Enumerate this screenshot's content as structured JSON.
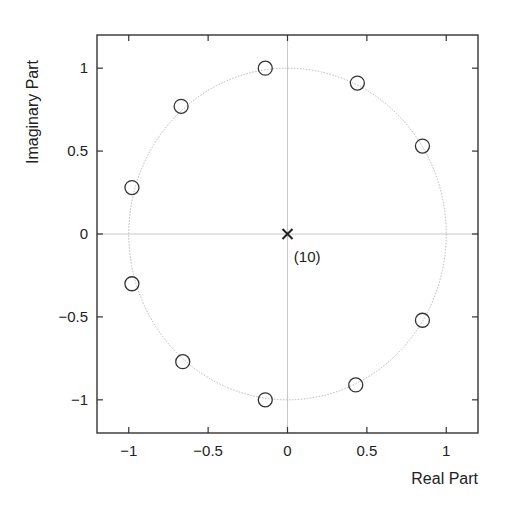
{
  "chart_data": {
    "type": "scatter",
    "subtype": "pole-zero plot",
    "title": "",
    "xlabel": "Real Part",
    "ylabel": "Imaginary Part",
    "xlim": [
      -1.2,
      1.2
    ],
    "ylim": [
      -1.2,
      1.2
    ],
    "xticks": [
      -1,
      -0.5,
      0,
      0.5,
      1
    ],
    "xtick_labels": [
      "−1",
      "−0.5",
      "0",
      "0.5",
      "1"
    ],
    "yticks": [
      -1,
      -0.5,
      0,
      0.5,
      1
    ],
    "ytick_labels": [
      "−1",
      "−0.5",
      "0",
      "0.5",
      "1"
    ],
    "grid": false,
    "unit_circle": true,
    "series": [
      {
        "name": "zeros",
        "marker": "o",
        "points": [
          {
            "x": -0.14,
            "y": 1.0
          },
          {
            "x": 0.44,
            "y": 0.91
          },
          {
            "x": 0.85,
            "y": 0.53
          },
          {
            "x": -0.67,
            "y": 0.77
          },
          {
            "x": -0.98,
            "y": 0.28
          },
          {
            "x": -0.98,
            "y": -0.3
          },
          {
            "x": -0.66,
            "y": -0.77
          },
          {
            "x": -0.14,
            "y": -1.0
          },
          {
            "x": 0.43,
            "y": -0.91
          },
          {
            "x": 0.85,
            "y": -0.52
          }
        ]
      },
      {
        "name": "poles",
        "marker": "x",
        "points": [
          {
            "x": 0,
            "y": 0,
            "multiplicity": 10
          }
        ]
      }
    ],
    "annotations": [
      {
        "text": "(10)",
        "x": 0.04,
        "y": -0.14
      }
    ]
  }
}
